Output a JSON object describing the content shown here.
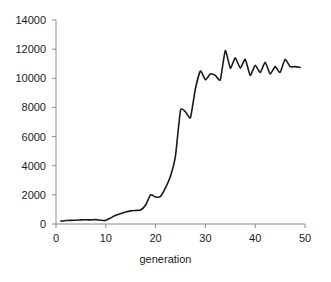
{
  "chart_data": {
    "type": "line",
    "title": "",
    "xlabel": "generation",
    "ylabel": "",
    "xlim": [
      0,
      50
    ],
    "ylim": [
      0,
      14000
    ],
    "xticks": [
      "0",
      "10",
      "20",
      "30",
      "40",
      "50"
    ],
    "yticks": [
      "0",
      "2000",
      "4000",
      "6000",
      "8000",
      "10000",
      "12000",
      "14000"
    ],
    "grid": false,
    "legend": null,
    "series": [
      {
        "name": "best fitness",
        "color": "#1a1a1a",
        "x": [
          1,
          2,
          3,
          4,
          5,
          6,
          7,
          8,
          9,
          10,
          11,
          12,
          13,
          14,
          15,
          16,
          17,
          18,
          19,
          20,
          21,
          22,
          23,
          24,
          25,
          26,
          27,
          28,
          29,
          30,
          31,
          32,
          33,
          34,
          35,
          36,
          37,
          38,
          39,
          40,
          41,
          42,
          43,
          44,
          45,
          46,
          47,
          48,
          49
        ],
        "values": [
          200,
          240,
          250,
          260,
          280,
          290,
          280,
          300,
          260,
          250,
          420,
          600,
          720,
          830,
          900,
          930,
          960,
          1300,
          2000,
          1850,
          1900,
          2500,
          3300,
          4700,
          7800,
          7700,
          7300,
          9300,
          10500,
          9900,
          10300,
          10200,
          9900,
          11900,
          10700,
          11400,
          10700,
          11300,
          10200,
          10900,
          10400,
          11100,
          10300,
          10800,
          10400,
          11300,
          10800,
          10800,
          10750
        ]
      }
    ]
  },
  "axis": {
    "line_color": "#8c8c8c",
    "curve_color": "#1a1a1a"
  }
}
